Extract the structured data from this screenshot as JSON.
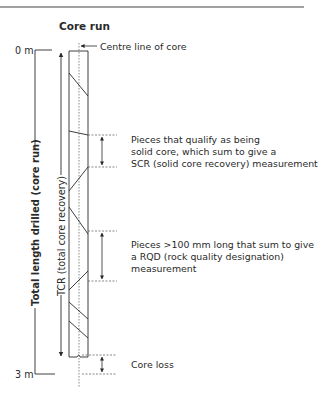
{
  "diagram": {
    "title": "Core run",
    "centre_line_label": "Centre line of core",
    "depth_top": "0 m",
    "depth_bottom": "3 m",
    "total_length_label": "Total length drilled (core run)",
    "tcr_label": "TCR (total core recovery)",
    "scr_annotation": {
      "line1": "Pieces that qualify as being",
      "line2": "solid core, which sum to give a",
      "line3": "SCR (solid core recovery) measurement"
    },
    "rqd_annotation": {
      "line1": "Pieces >100 mm long that sum to give",
      "line2": "a RQD (rock quality designation)",
      "line3": "measurement"
    },
    "core_loss_label": "Core loss",
    "colors": {
      "line": "#2a2a2a",
      "dashed": "#555555",
      "top_rule": "#444444"
    }
  }
}
